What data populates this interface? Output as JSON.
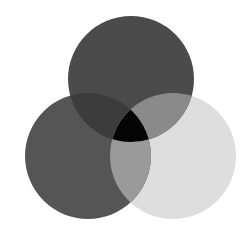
{
  "diagram": {
    "type": "venn-3",
    "background": "#ffffff",
    "circles": [
      {
        "id": "top",
        "cx": 131,
        "cy": 79,
        "r": 63,
        "color": "#4b4b4b"
      },
      {
        "id": "left",
        "cx": 88,
        "cy": 156,
        "r": 63,
        "color": "#555555"
      },
      {
        "id": "right",
        "cx": 173,
        "cy": 156,
        "r": 63,
        "color": "#dedede"
      }
    ],
    "overlaps": {
      "top_left": "#3c3c3c",
      "top_right": "#8a8a8a",
      "left_right": "#9a9a9a",
      "center": "#050505"
    }
  }
}
